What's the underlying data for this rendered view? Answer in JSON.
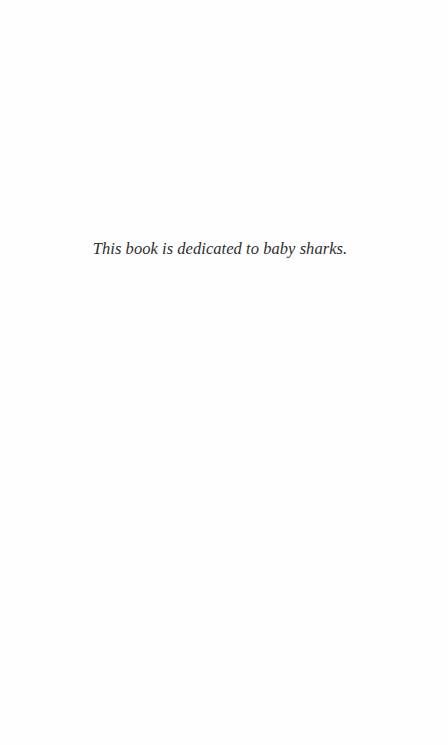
{
  "page": {
    "type": "dedication-page",
    "background_color": "#fefefe",
    "text_color": "#2e2e2e"
  },
  "dedication": {
    "text": "This book is dedicated to baby sharks."
  }
}
